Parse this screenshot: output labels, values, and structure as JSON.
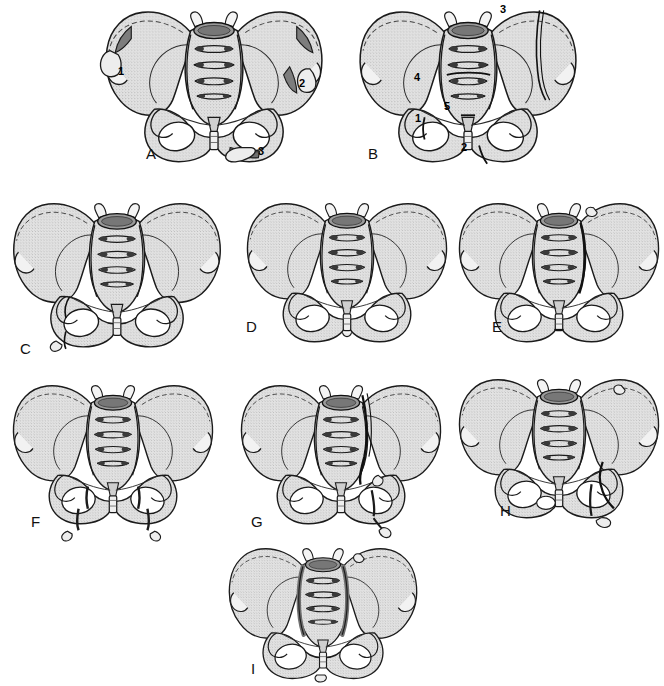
{
  "figure": {
    "type": "medical-illustration",
    "view": "anteroposterior pelvis",
    "panel_count": 9,
    "background_color": "#ffffff",
    "bone_fill_color": "#dcdcdc",
    "outline_color": "#1a1a1a",
    "fracture_mark_color": "#7a7a7a",
    "rows": [
      {
        "letters": [
          "A",
          "B"
        ]
      },
      {
        "letters": [
          "C",
          "D",
          "E"
        ]
      },
      {
        "letters": [
          "F",
          "G",
          "H"
        ]
      },
      {
        "letters": [
          "I"
        ]
      }
    ]
  },
  "panels": [
    {
      "letter": "A",
      "letter_x": 146,
      "letter_y": 145,
      "origin_x": 98,
      "origin_y": 4,
      "scale": 1.0,
      "markers": [
        {
          "label": "1",
          "x": 118,
          "y": 66
        },
        {
          "label": "2",
          "x": 299,
          "y": 78
        },
        {
          "label": "3",
          "x": 258,
          "y": 146
        }
      ]
    },
    {
      "letter": "B",
      "letter_x": 368,
      "letter_y": 145,
      "origin_x": 352,
      "origin_y": 4,
      "scale": 1.0,
      "markers": [
        {
          "label": "3",
          "x": 500,
          "y": 4
        },
        {
          "label": "4",
          "x": 414,
          "y": 72
        },
        {
          "label": "5",
          "x": 444,
          "y": 101
        },
        {
          "label": "1",
          "x": 415,
          "y": 113
        },
        {
          "label": "2",
          "x": 461,
          "y": 142
        }
      ]
    },
    {
      "letter": "C",
      "letter_x": 20,
      "letter_y": 340,
      "origin_x": 6,
      "origin_y": 196,
      "scale": 1.0,
      "markers": []
    },
    {
      "letter": "D",
      "letter_x": 246,
      "letter_y": 318,
      "origin_x": 240,
      "origin_y": 196,
      "scale": 0.94,
      "markers": []
    },
    {
      "letter": "E",
      "letter_x": 492,
      "letter_y": 318,
      "origin_x": 452,
      "origin_y": 196,
      "scale": 0.94,
      "markers": []
    },
    {
      "letter": "F",
      "letter_x": 31,
      "letter_y": 513,
      "origin_x": 6,
      "origin_y": 378,
      "scale": 0.94,
      "markers": []
    },
    {
      "letter": "G",
      "letter_x": 251,
      "letter_y": 513,
      "origin_x": 234,
      "origin_y": 378,
      "scale": 0.94,
      "markers": []
    },
    {
      "letter": "H",
      "letter_x": 500,
      "letter_y": 502,
      "origin_x": 452,
      "origin_y": 372,
      "scale": 0.94,
      "markers": []
    },
    {
      "letter": "I",
      "letter_x": 251,
      "letter_y": 660,
      "origin_x": 212,
      "origin_y": 542,
      "scale": 0.96,
      "markers": []
    }
  ]
}
